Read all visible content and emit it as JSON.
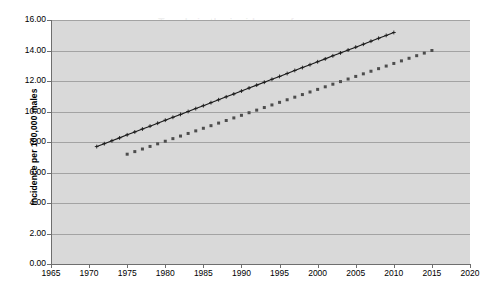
{
  "chart_data": {
    "type": "line",
    "title": "Trends in the incidence of cancer\nover years",
    "xlabel": "",
    "ylabel": "Incidence per 100,000 males",
    "xlim": [
      1965,
      2020
    ],
    "ylim": [
      0.0,
      16.0
    ],
    "grid": true,
    "legend_position": "none",
    "xticks": [
      1965,
      1970,
      1975,
      1980,
      1985,
      1990,
      1995,
      2000,
      2005,
      2010,
      2015,
      2020
    ],
    "xtick_labels": [
      "1965",
      "1970",
      "1975",
      "1980",
      "1985",
      "1990",
      "1995",
      "2000",
      "2005",
      "2010",
      "2015",
      "2020"
    ],
    "yticks": [
      0.0,
      2.0,
      4.0,
      6.0,
      8.0,
      10.0,
      12.0,
      14.0,
      16.0
    ],
    "ytick_labels": [
      "0.00",
      "2.00",
      "4.00",
      "6.00",
      "8.00",
      "10.00",
      "12.00",
      "14.00",
      "16.00"
    ],
    "series": [
      {
        "name": "Series 1",
        "style": "solid-line-with-cross-markers",
        "color": "#1a1a1a",
        "x": [
          1971,
          1972,
          1973,
          1974,
          1975,
          1976,
          1977,
          1978,
          1979,
          1980,
          1981,
          1982,
          1983,
          1984,
          1985,
          1986,
          1987,
          1988,
          1989,
          1990,
          1991,
          1992,
          1993,
          1994,
          1995,
          1996,
          1997,
          1998,
          1999,
          2000,
          2001,
          2002,
          2003,
          2004,
          2005,
          2006,
          2007,
          2008,
          2009,
          2010
        ],
        "values": [
          7.7,
          7.89,
          8.08,
          8.27,
          8.47,
          8.66,
          8.85,
          9.04,
          9.23,
          9.43,
          9.62,
          9.81,
          10.0,
          10.19,
          10.38,
          10.58,
          10.77,
          10.96,
          11.15,
          11.34,
          11.54,
          11.73,
          11.92,
          12.11,
          12.3,
          12.49,
          12.69,
          12.88,
          13.07,
          13.26,
          13.45,
          13.65,
          13.84,
          14.03,
          14.22,
          14.41,
          14.61,
          14.8,
          14.99,
          15.18
        ]
      },
      {
        "name": "Series 2",
        "style": "dotted-square-markers",
        "color": "#4d4d4d",
        "x": [
          1975,
          1976,
          1977,
          1978,
          1979,
          1980,
          1981,
          1982,
          1983,
          1984,
          1985,
          1986,
          1987,
          1988,
          1989,
          1990,
          1991,
          1992,
          1993,
          1994,
          1995,
          1996,
          1997,
          1998,
          1999,
          2000,
          2001,
          2002,
          2003,
          2004,
          2005,
          2006,
          2007,
          2008,
          2009,
          2010,
          2011,
          2012,
          2013,
          2014,
          2015
        ],
        "values": [
          7.2,
          7.37,
          7.54,
          7.71,
          7.88,
          8.05,
          8.22,
          8.39,
          8.56,
          8.73,
          8.9,
          9.07,
          9.24,
          9.41,
          9.58,
          9.75,
          9.92,
          10.09,
          10.26,
          10.43,
          10.6,
          10.77,
          10.94,
          11.11,
          11.28,
          11.45,
          11.62,
          11.79,
          11.96,
          12.13,
          12.3,
          12.47,
          12.64,
          12.81,
          12.98,
          13.15,
          13.32,
          13.49,
          13.66,
          13.83,
          14.0
        ]
      }
    ],
    "colors": {
      "plot_background": "#d9d9d9",
      "gridline": "#a3a3a3",
      "axis": "#6e6e6e",
      "page_background": "#ffffff"
    }
  }
}
